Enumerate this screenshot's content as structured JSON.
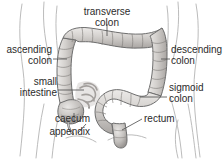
{
  "figure": {
    "colors": {
      "background": "#ffffff",
      "text": "#2b2b2b",
      "leader_line": "#4a4a4a",
      "body_outline": "#b8b8b8",
      "organ_outline": "#6e6e6e",
      "organ_fill_light": "#e2e0de",
      "organ_fill_mid": "#c9c6c3",
      "organ_fill_dark": "#a8a4a1",
      "organ_shadow": "#8a8784"
    }
  },
  "labels": {
    "transverse_colon": {
      "line1": "transverse",
      "line2": "colon"
    },
    "ascending_colon": {
      "line1": "ascending",
      "line2": "colon"
    },
    "small_intestine": {
      "line1": "small",
      "line2": "intestine"
    },
    "caecum": {
      "line1": "caecum"
    },
    "appendix": {
      "line1": "appendix"
    },
    "descending_colon": {
      "line1": "descending",
      "line2": "colon"
    },
    "sigmoid_colon": {
      "line1": "sigmoid",
      "line2": "colon"
    },
    "rectum": {
      "line1": "rectum"
    }
  },
  "structures": [
    {
      "name": "transverse-colon",
      "label": "transverse colon"
    },
    {
      "name": "ascending-colon",
      "label": "ascending colon"
    },
    {
      "name": "descending-colon",
      "label": "descending colon"
    },
    {
      "name": "sigmoid-colon",
      "label": "sigmoid colon"
    },
    {
      "name": "rectum",
      "label": "rectum"
    },
    {
      "name": "caecum",
      "label": "caecum"
    },
    {
      "name": "appendix",
      "label": "appendix"
    },
    {
      "name": "small-intestine",
      "label": "small intestine"
    }
  ]
}
